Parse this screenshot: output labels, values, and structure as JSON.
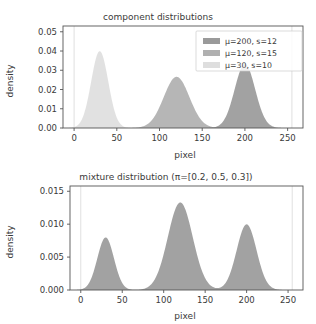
{
  "chart_data": [
    {
      "type": "area",
      "panel": "top",
      "title": "component distributions",
      "xlabel": "pixel",
      "ylabel": "density",
      "xlim": [
        -13,
        268
      ],
      "ylim": [
        0.0,
        0.053
      ],
      "xticks": [
        0,
        50,
        100,
        150,
        200,
        250
      ],
      "xticklabels": [
        "0",
        "50",
        "100",
        "150",
        "200",
        "250"
      ],
      "yticks": [
        0.0,
        0.01,
        0.02,
        0.03,
        0.04,
        0.05
      ],
      "yticklabels": [
        "0.00",
        "0.01",
        "0.02",
        "0.03",
        "0.04",
        "0.05"
      ],
      "grid": false,
      "legend_position": "upper right",
      "marker_lines": [
        0,
        255
      ],
      "series": [
        {
          "name": "μ=200, s=12",
          "mu": 200,
          "sigma": 12,
          "weight": 1.0,
          "peak": 0.0207,
          "color": "#9a9a9a",
          "legend_order": 0
        },
        {
          "name": "μ=120, s=15",
          "mu": 120,
          "sigma": 15,
          "weight": 1.0,
          "peak": 0.0159,
          "color": "#b0b0b0",
          "legend_order": 1
        },
        {
          "name": "μ=30, s=10",
          "mu": 30,
          "sigma": 10,
          "weight": 1.0,
          "peak": 0.0241,
          "color": "#dedede",
          "legend_order": 2
        }
      ]
    },
    {
      "type": "area",
      "panel": "bottom",
      "title": "mixture distribution (π=[0.2, 0.5, 0.3])",
      "xlabel": "pixel",
      "ylabel": "density",
      "xlim": [
        -13,
        268
      ],
      "ylim": [
        0.0,
        0.0158
      ],
      "xticks": [
        0,
        50,
        100,
        150,
        200,
        250
      ],
      "xticklabels": [
        "0",
        "50",
        "100",
        "150",
        "200",
        "250"
      ],
      "yticks": [
        0.0,
        0.005,
        0.01,
        0.015
      ],
      "yticklabels": [
        "0.000",
        "0.005",
        "0.010",
        "0.015"
      ],
      "grid": false,
      "legend_position": "none",
      "marker_lines": [
        0,
        255
      ],
      "weights": [
        0.2,
        0.5,
        0.3
      ],
      "components": [
        {
          "mu": 30,
          "sigma": 10,
          "weight": 0.2
        },
        {
          "mu": 120,
          "sigma": 15,
          "weight": 0.5
        },
        {
          "mu": 200,
          "sigma": 12,
          "weight": 0.3
        }
      ],
      "peaks": [
        {
          "x": 30,
          "y": 0.0075
        },
        {
          "x": 120,
          "y": 0.0083
        },
        {
          "x": 200,
          "y": 0.0044
        }
      ],
      "color": "#9a9a9a"
    }
  ],
  "figure": {
    "background": "#ffffff",
    "axis_color": "#555555",
    "text_color": "#3a3a3a"
  }
}
